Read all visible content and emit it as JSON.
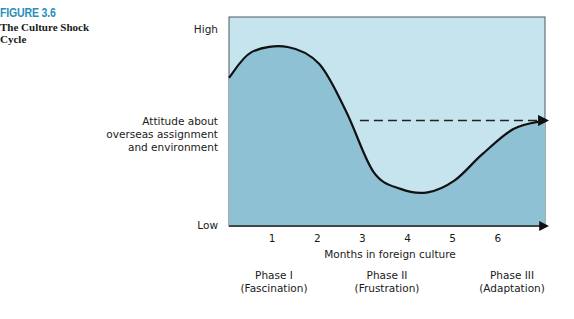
{
  "figure": {
    "number": "FIGURE 3.6",
    "title": "The Culture Shock Cycle"
  },
  "chart_data": {
    "type": "line",
    "title": "The Culture Shock Cycle",
    "ylabel": [
      "Attitude about",
      "overseas assignment",
      "and environment"
    ],
    "xlabel": "Months in foreign culture",
    "y_ticks": {
      "high": "High",
      "low": "Low"
    },
    "x_ticks": [
      "1",
      "2",
      "3",
      "4",
      "5",
      "6"
    ],
    "xlim": [
      0,
      7
    ],
    "ylim": [
      0,
      1
    ],
    "curve": {
      "description": "Attitude curve (relative level 0=Low, 1=High)",
      "x": [
        0,
        0.5,
        1.3,
        2.0,
        2.6,
        3.2,
        3.8,
        4.4,
        5.0,
        5.6,
        6.3,
        7.0
      ],
      "y": [
        0.75,
        0.9,
        0.93,
        0.83,
        0.55,
        0.2,
        0.1,
        0.08,
        0.15,
        0.3,
        0.45,
        0.5
      ]
    },
    "reference_line": {
      "style": "dashed",
      "from_x": 2.9,
      "to_x": 7.0,
      "y": 0.5
    },
    "phases": [
      {
        "name": "Phase I",
        "desc": "(Fascination)"
      },
      {
        "name": "Phase II",
        "desc": "(Frustration)"
      },
      {
        "name": "Phase III",
        "desc": "(Adaptation)"
      }
    ],
    "colors": {
      "light_fill": "#c6e4ee",
      "dark_fill": "#8fc1d4",
      "line": "#111111",
      "figure_number": "#2a8fb8"
    }
  }
}
